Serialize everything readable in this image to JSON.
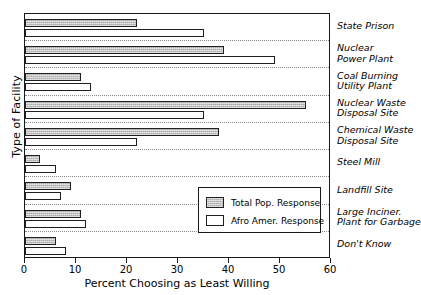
{
  "chart_data": {
    "type": "bar",
    "orientation": "horizontal",
    "title": "",
    "xlabel": "Percent Choosing as Least Willing",
    "ylabel": "Type of Facility",
    "xlim": [
      0,
      60
    ],
    "xticks": [
      0,
      10,
      20,
      30,
      40,
      50,
      60
    ],
    "grid": "dotted category separators only",
    "legend_position": "inside lower-right",
    "categories": [
      "State Prison",
      "Nuclear\nPower Plant",
      "Coal Burning\nUtility Plant",
      "Nuclear Waste\nDisposal Site",
      "Chemical Waste\nDisposal Site",
      "Steel Mill",
      "Landfill Site",
      "Large Inciner.\nPlant for Garbage",
      "Don't Know"
    ],
    "series": [
      {
        "name": "Total Pop. Response",
        "color": "#ababab",
        "values": [
          22,
          39,
          11,
          55,
          38,
          3,
          9,
          11,
          6
        ]
      },
      {
        "name": "Afro Amer. Response",
        "color": "#ffffff",
        "values": [
          35,
          49,
          13,
          35,
          22,
          6,
          7,
          12,
          8
        ]
      }
    ]
  },
  "legend": {
    "items": [
      {
        "label": "Total Pop. Response",
        "swatch": "total"
      },
      {
        "label": "Afro Amer. Response",
        "swatch": "afro"
      }
    ]
  },
  "axis": {
    "x_tick_labels": [
      "0",
      "10",
      "20",
      "30",
      "40",
      "50",
      "60"
    ]
  }
}
